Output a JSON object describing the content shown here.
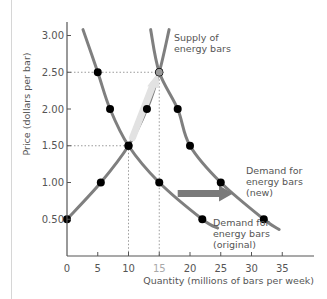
{
  "chart_data": {
    "type": "line",
    "title": "",
    "xlabel": "Quantity (millions of bars per week)",
    "ylabel": "Price (dollars per bar)",
    "xlim": [
      0,
      37
    ],
    "ylim": [
      0,
      3.2
    ],
    "x_ticks": [
      "0",
      "5",
      "10",
      "15",
      "20",
      "25",
      "30",
      "35"
    ],
    "y_ticks": [
      "0.50",
      "1.00",
      "1.50",
      "2.00",
      "2.50",
      "3.00"
    ],
    "grid": false,
    "series": [
      {
        "name": "Supply of energy bars",
        "label_lines": [
          "Supply of",
          "energy bars"
        ],
        "points": [
          [
            0,
            0.5
          ],
          [
            5.5,
            1.0
          ],
          [
            10,
            1.5
          ],
          [
            13,
            2.0
          ],
          [
            15,
            2.5
          ]
        ]
      },
      {
        "name": "Demand for energy bars (original)",
        "label_lines": [
          "Demand for",
          "energy bars",
          "(original)"
        ],
        "points": [
          [
            5,
            2.5
          ],
          [
            7,
            2.0
          ],
          [
            10,
            1.5
          ],
          [
            15,
            1.0
          ],
          [
            22,
            0.5
          ]
        ]
      },
      {
        "name": "Demand for energy bars (new)",
        "label_lines": [
          "Demand for",
          "energy bars",
          "(new)"
        ],
        "points": [
          [
            15,
            2.5
          ],
          [
            18,
            2.0
          ],
          [
            20,
            1.5
          ],
          [
            25,
            1.0
          ],
          [
            32,
            0.5
          ]
        ]
      }
    ],
    "equilibria": [
      {
        "name": "original",
        "quantity": 10,
        "price": 1.5
      },
      {
        "name": "new",
        "quantity": 15,
        "price": 2.5
      }
    ],
    "annotations": [
      {
        "type": "arrow",
        "description": "Demand shift rightward",
        "from": [
          18,
          0.85
        ],
        "to": [
          27,
          0.85
        ]
      },
      {
        "type": "arrow",
        "description": "Movement along supply curve",
        "from": [
          10,
          1.5
        ],
        "to": [
          15,
          2.5
        ]
      }
    ],
    "colors": {
      "curve": "#7f7f7f",
      "point": "#000000",
      "arrow": "#7a7a7a",
      "guide": "#9a9a9a",
      "axis": "#555555"
    }
  }
}
